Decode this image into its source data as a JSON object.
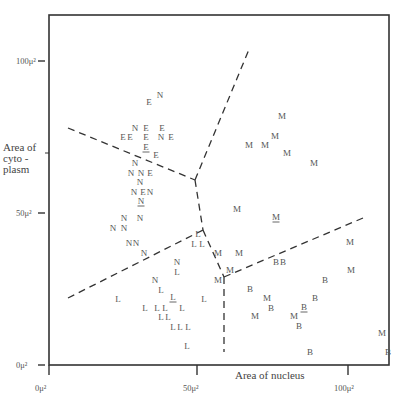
{
  "chart_data": {
    "type": "scatter",
    "title": "",
    "xlabel": "Area of nucleus",
    "ylabel": "Area of cyto- plasm",
    "ylabel_lines": [
      "Area of",
      "cyto -",
      "plasm"
    ],
    "xlim": [
      0,
      110
    ],
    "ylim": [
      0,
      120
    ],
    "x_ticks": [
      {
        "value": 0,
        "label": "0μ²"
      },
      {
        "value": 50,
        "label": "50μ²"
      },
      {
        "value": 100,
        "label": "100μ²"
      }
    ],
    "y_ticks": [
      {
        "value": 0,
        "label": "0μ²"
      },
      {
        "value": 50,
        "label": "50μ²"
      },
      {
        "value": 100,
        "label": "100μ²"
      }
    ],
    "legend": [
      "E",
      "N",
      "M",
      "L",
      "B"
    ],
    "plot_frame": {
      "left": 49,
      "top": 15,
      "right": 389,
      "bottom": 365
    },
    "axis_px": {
      "x0": 49,
      "x50": 197,
      "x100": 348,
      "y0": 365,
      "y50": 213,
      "y100": 61
    },
    "points_px": [
      {
        "t": "N",
        "x": 160,
        "y": 95
      },
      {
        "t": "E",
        "x": 149,
        "y": 102
      },
      {
        "t": "N",
        "x": 135,
        "y": 128
      },
      {
        "t": "E",
        "x": 146,
        "y": 128
      },
      {
        "t": "E",
        "x": 162,
        "y": 128
      },
      {
        "t": "E",
        "x": 123,
        "y": 137
      },
      {
        "t": "E",
        "x": 130,
        "y": 137
      },
      {
        "t": "E",
        "x": 146,
        "y": 137
      },
      {
        "t": "N",
        "x": 161,
        "y": 137
      },
      {
        "t": "E",
        "x": 171,
        "y": 137
      },
      {
        "t": "E",
        "x": 146,
        "y": 147,
        "u": true
      },
      {
        "t": "E",
        "x": 156,
        "y": 155
      },
      {
        "t": "N",
        "x": 135,
        "y": 163
      },
      {
        "t": "N",
        "x": 131,
        "y": 173
      },
      {
        "t": "N",
        "x": 141,
        "y": 173
      },
      {
        "t": "E",
        "x": 150,
        "y": 173
      },
      {
        "t": "N",
        "x": 140,
        "y": 182
      },
      {
        "t": "N",
        "x": 134,
        "y": 192
      },
      {
        "t": "E",
        "x": 143,
        "y": 192
      },
      {
        "t": "N",
        "x": 150,
        "y": 192
      },
      {
        "t": "N",
        "x": 141,
        "y": 201,
        "u": true
      },
      {
        "t": "N",
        "x": 124,
        "y": 218
      },
      {
        "t": "N",
        "x": 140,
        "y": 218
      },
      {
        "t": "N",
        "x": 113,
        "y": 228
      },
      {
        "t": "N",
        "x": 124,
        "y": 228
      },
      {
        "t": "N",
        "x": 129,
        "y": 243
      },
      {
        "t": "N",
        "x": 136,
        "y": 243
      },
      {
        "t": "N",
        "x": 144,
        "y": 253
      },
      {
        "t": "L",
        "x": 198,
        "y": 234
      },
      {
        "t": "L",
        "x": 194,
        "y": 244
      },
      {
        "t": "L",
        "x": 202,
        "y": 244
      },
      {
        "t": "N",
        "x": 177,
        "y": 262
      },
      {
        "t": "L",
        "x": 177,
        "y": 272
      },
      {
        "t": "N",
        "x": 155,
        "y": 280
      },
      {
        "t": "L",
        "x": 161,
        "y": 290
      },
      {
        "t": "L",
        "x": 118,
        "y": 299
      },
      {
        "t": "L",
        "x": 173,
        "y": 297,
        "u": true
      },
      {
        "t": "L",
        "x": 204,
        "y": 299
      },
      {
        "t": "L",
        "x": 145,
        "y": 308
      },
      {
        "t": "L",
        "x": 157,
        "y": 308
      },
      {
        "t": "L",
        "x": 165,
        "y": 308
      },
      {
        "t": "L",
        "x": 182,
        "y": 308
      },
      {
        "t": "L",
        "x": 161,
        "y": 317
      },
      {
        "t": "L",
        "x": 168,
        "y": 317
      },
      {
        "t": "L",
        "x": 173,
        "y": 327
      },
      {
        "t": "L",
        "x": 180,
        "y": 327
      },
      {
        "t": "L",
        "x": 188,
        "y": 327
      },
      {
        "t": "L",
        "x": 187,
        "y": 346
      },
      {
        "t": "M",
        "x": 282,
        "y": 116
      },
      {
        "t": "M",
        "x": 275,
        "y": 136
      },
      {
        "t": "M",
        "x": 249,
        "y": 145
      },
      {
        "t": "M",
        "x": 265,
        "y": 145
      },
      {
        "t": "M",
        "x": 287,
        "y": 153
      },
      {
        "t": "M",
        "x": 314,
        "y": 163
      },
      {
        "t": "M",
        "x": 237,
        "y": 209
      },
      {
        "t": "M",
        "x": 276,
        "y": 217,
        "u": true
      },
      {
        "t": "M",
        "x": 218,
        "y": 253
      },
      {
        "t": "M",
        "x": 239,
        "y": 253
      },
      {
        "t": "M",
        "x": 350,
        "y": 242
      },
      {
        "t": "M",
        "x": 230,
        "y": 270
      },
      {
        "t": "M",
        "x": 218,
        "y": 280
      },
      {
        "t": "B",
        "x": 276,
        "y": 262
      },
      {
        "t": "B",
        "x": 283,
        "y": 262
      },
      {
        "t": "M",
        "x": 351,
        "y": 270
      },
      {
        "t": "B",
        "x": 325,
        "y": 280
      },
      {
        "t": "B",
        "x": 250,
        "y": 289
      },
      {
        "t": "M",
        "x": 267,
        "y": 298
      },
      {
        "t": "B",
        "x": 315,
        "y": 298
      },
      {
        "t": "B",
        "x": 271,
        "y": 308
      },
      {
        "t": "B",
        "x": 304,
        "y": 307,
        "u": true
      },
      {
        "t": "M",
        "x": 255,
        "y": 316
      },
      {
        "t": "M",
        "x": 294,
        "y": 316
      },
      {
        "t": "B",
        "x": 299,
        "y": 326
      },
      {
        "t": "M",
        "x": 382,
        "y": 333
      },
      {
        "t": "B",
        "x": 310,
        "y": 352
      },
      {
        "t": "B",
        "x": 388,
        "y": 352
      }
    ],
    "boundaries_px": [
      {
        "from": [
          68,
          128
        ],
        "to": [
          195,
          180
        ]
      },
      {
        "from": [
          195,
          180
        ],
        "to": [
          250,
          47
        ]
      },
      {
        "from": [
          195,
          180
        ],
        "to": [
          203,
          230
        ]
      },
      {
        "from": [
          68,
          298
        ],
        "to": [
          203,
          230
        ]
      },
      {
        "from": [
          203,
          230
        ],
        "to": [
          224,
          277
        ]
      },
      {
        "from": [
          224,
          277
        ],
        "to": [
          363,
          218
        ]
      },
      {
        "from": [
          224,
          277
        ],
        "to": [
          224,
          352
        ]
      }
    ]
  }
}
